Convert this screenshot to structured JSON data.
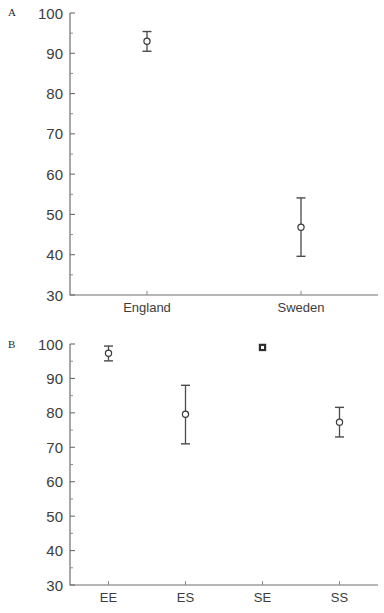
{
  "figure": {
    "panel_a_label": "A",
    "panel_b_label": "B"
  },
  "chart_data": [
    {
      "type": "scatter",
      "panel": "A",
      "title": "",
      "xlabel": "",
      "ylabel": "",
      "ylim": [
        30,
        100
      ],
      "yticks": [
        30,
        40,
        50,
        60,
        70,
        80,
        90,
        100
      ],
      "ytick_labels": [
        "30",
        "40",
        "50",
        "60",
        "70",
        "80",
        "90",
        "100"
      ],
      "minor_ticks": [
        35,
        45,
        55,
        65,
        75,
        85,
        95
      ],
      "grid": false,
      "legend": "none",
      "categories": [
        "England",
        "Sweden"
      ],
      "values": [
        93.0,
        46.8
      ],
      "error_low": [
        90.5,
        39.6
      ],
      "error_high": [
        95.4,
        54.1
      ],
      "marker": "open-circle"
    },
    {
      "type": "scatter",
      "panel": "B",
      "title": "",
      "xlabel": "",
      "ylabel": "",
      "ylim": [
        30,
        100
      ],
      "yticks": [
        30,
        40,
        50,
        60,
        70,
        80,
        90,
        100
      ],
      "ytick_labels": [
        "30",
        "40",
        "50",
        "60",
        "70",
        "80",
        "90",
        "100"
      ],
      "minor_ticks": [
        35,
        45,
        55,
        65,
        75,
        85,
        95
      ],
      "grid": false,
      "legend": "none",
      "categories": [
        "EE",
        "ES",
        "SE",
        "SS"
      ],
      "values": [
        97.3,
        79.6,
        99.0,
        77.3
      ],
      "error_low": [
        95.1,
        71.0,
        98.6,
        73.0
      ],
      "error_high": [
        99.4,
        88.0,
        99.4,
        81.6
      ],
      "marker": "open-circle"
    }
  ],
  "colors": {
    "axis": "#6e6e6e",
    "marker": "#3a3a3a",
    "error_bar": "#4a4a4a",
    "text": "#3d3d3d",
    "background": "#ffffff"
  }
}
